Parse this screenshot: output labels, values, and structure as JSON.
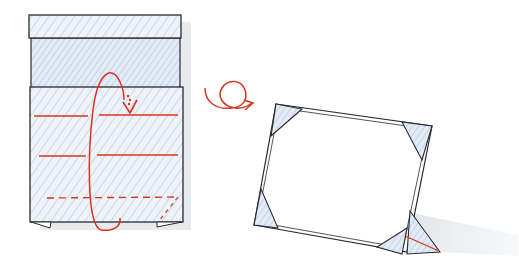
{
  "diagram": {
    "type": "origami-instruction",
    "steps": [
      {
        "name": "fold-step",
        "description": "Paper with top strip folded down; red valley-fold lines; dashed diagonal fold at bottom right; looping arrow indicates turn-over and fold behind",
        "elements": [
          "top-strip",
          "middle-section",
          "main-panel",
          "valley-fold-line-1",
          "valley-fold-line-2",
          "dashed-fold-line",
          "turn-over-loop-arrow",
          "fold-down-arrow"
        ]
      },
      {
        "name": "turn-over-symbol",
        "description": "Red looping arrow indicating turn the model over"
      },
      {
        "name": "result-frame",
        "description": "Finished standing photo frame with four triangular corner pockets and a triangular stand at the back",
        "elements": [
          "frame-outline",
          "corner-pocket-top-left",
          "corner-pocket-top-right",
          "corner-pocket-bottom-left",
          "corner-pocket-bottom-right",
          "stand-triangle",
          "stand-crease-line",
          "shadow"
        ]
      }
    ],
    "colors": {
      "line": "#2a2a2e",
      "fold_red": "#d9341f",
      "paper_shade": "#dbe6f3",
      "hatch": "#c7d6ea",
      "shadow": "#e6e8ec"
    }
  }
}
